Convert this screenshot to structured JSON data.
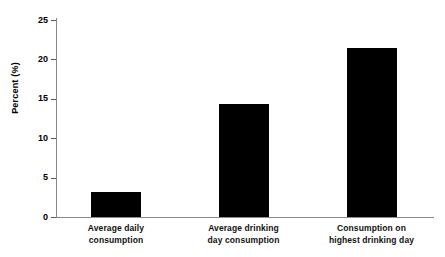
{
  "chart_data": {
    "type": "bar",
    "title": "",
    "subtitle": "",
    "xlabel": "",
    "ylabel": "Percent (%)",
    "ylim": [
      0,
      25
    ],
    "ytick_values": [
      0,
      5,
      10,
      15,
      20,
      25
    ],
    "ytick_labels": [
      "0",
      "5",
      "10",
      "15",
      "20",
      "25"
    ],
    "grid": false,
    "legend": false,
    "legend_position": "none",
    "bar_color": "#000000",
    "axis_color": "#888888",
    "categories": [
      "Average daily consumption",
      "Average drinking day consumption",
      "Consumption on highest drinking day"
    ],
    "category_lines": [
      [
        "Average daily",
        "consumption"
      ],
      [
        "Average drinking",
        "day consumption"
      ],
      [
        "Consumption on",
        "highest drinking day"
      ]
    ],
    "values": [
      3.2,
      14.3,
      21.4
    ],
    "series": [
      {
        "name": "Percent",
        "values": [
          3.2,
          14.3,
          21.4
        ]
      }
    ]
  }
}
